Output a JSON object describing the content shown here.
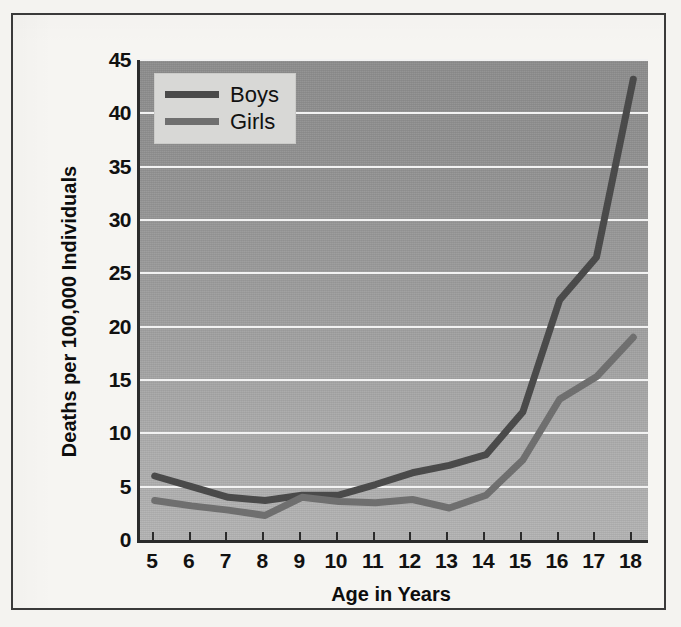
{
  "chart_data": {
    "type": "line",
    "title": "",
    "xlabel": "Age in Years",
    "ylabel": "Deaths per 100,000 Individuals",
    "x": [
      5,
      6,
      7,
      8,
      9,
      10,
      11,
      12,
      13,
      14,
      15,
      16,
      17,
      18
    ],
    "xtick_labels": [
      "5",
      "6",
      "7",
      "8",
      "9",
      "10",
      "11",
      "12",
      "13",
      "14",
      "15",
      "16",
      "17",
      "18"
    ],
    "ytick_labels": [
      "5",
      "10",
      "15",
      "20",
      "25",
      "30",
      "35",
      "40",
      "45"
    ],
    "ytick_values": [
      5,
      10,
      15,
      20,
      25,
      30,
      35,
      40,
      45
    ],
    "xlim": [
      4.6,
      18.4
    ],
    "ylim": [
      0,
      45
    ],
    "grid": "horizontal",
    "legend_position": "top-left-inside",
    "series": [
      {
        "name": "Boys",
        "color": "#4a4a4a",
        "values": [
          6.0,
          5.0,
          4.0,
          3.7,
          4.2,
          4.2,
          5.2,
          6.3,
          7.0,
          8.0,
          12.0,
          22.5,
          26.5,
          43.2
        ]
      },
      {
        "name": "Girls",
        "color": "#6f6f6f",
        "values": [
          3.7,
          3.2,
          2.8,
          2.3,
          4.0,
          3.6,
          3.5,
          3.8,
          3.0,
          4.2,
          7.5,
          13.2,
          15.3,
          19.0
        ]
      }
    ]
  },
  "legend": {
    "items": [
      {
        "label": "Boys",
        "color": "#4a4a4a"
      },
      {
        "label": "Girls",
        "color": "#6f6f6f"
      }
    ]
  },
  "colors": {
    "page_background": "#f4f3f0",
    "frame": "#3a3a3a",
    "plot_background_top": "#8d8d8d",
    "plot_background_bottom": "#b3b3b3",
    "gridline": "#f2f2f2",
    "axis": "#2b2b2b",
    "legend_background": "#d8d8d6",
    "text": "#111111"
  }
}
